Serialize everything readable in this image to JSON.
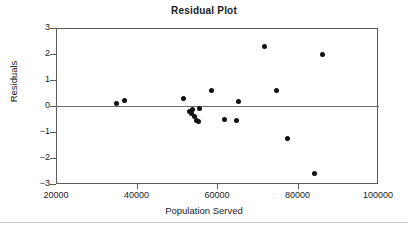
{
  "chart_data": {
    "type": "scatter",
    "title": "Residual Plot",
    "xlabel": "Population Served",
    "ylabel": "Residuals",
    "xlim": [
      20000,
      100000
    ],
    "ylim": [
      -3,
      3
    ],
    "xticks": [
      20000,
      40000,
      60000,
      80000,
      100000
    ],
    "xtick_labels": [
      "20000",
      "40000",
      "60000",
      "80000",
      "100000"
    ],
    "yticks": [
      3,
      2,
      1,
      0,
      -1,
      -2,
      -3
    ],
    "ytick_labels": [
      "3",
      "2",
      "1",
      "0",
      "−1",
      "−2",
      "−3"
    ],
    "grid": false,
    "legend": null,
    "reference_line": {
      "y": 0,
      "color": "#6e6e6e"
    },
    "marker": {
      "shape": "circle",
      "color": "#111111",
      "size": 5
    },
    "points": [
      {
        "x": 35000,
        "y": 0.1
      },
      {
        "x": 37000,
        "y": 0.2
      },
      {
        "x": 51800,
        "y": 0.27
      },
      {
        "x": 53200,
        "y": -0.22
      },
      {
        "x": 53600,
        "y": -0.3
      },
      {
        "x": 54000,
        "y": -0.15
      },
      {
        "x": 54400,
        "y": -0.4
      },
      {
        "x": 54800,
        "y": -0.55
      },
      {
        "x": 55300,
        "y": -0.58
      },
      {
        "x": 55600,
        "y": -0.1
      },
      {
        "x": 58700,
        "y": 0.59
      },
      {
        "x": 61900,
        "y": -0.51
      },
      {
        "x": 64900,
        "y": -0.56
      },
      {
        "x": 65300,
        "y": 0.19
      },
      {
        "x": 71800,
        "y": 2.3
      },
      {
        "x": 74800,
        "y": 0.6
      },
      {
        "x": 77400,
        "y": -1.24
      },
      {
        "x": 84300,
        "y": -2.61
      },
      {
        "x": 86100,
        "y": 1.97
      }
    ]
  }
}
